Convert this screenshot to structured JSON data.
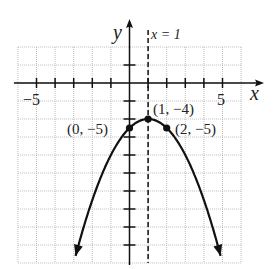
{
  "chart_data": {
    "type": "line",
    "title": "",
    "function": "y = -(x - 1)^2 - 4",
    "xlabel": "x",
    "ylabel": "y",
    "xlim": [
      -6,
      6
    ],
    "ylim": [
      -20,
      4
    ],
    "x_tick_labels": [
      "-5",
      "5"
    ],
    "x_ticks": [
      -5,
      -4,
      -3,
      -2,
      -1,
      1,
      2,
      3,
      4,
      5
    ],
    "y_ticks": [
      2,
      -2,
      -4,
      -6,
      -8,
      -10,
      -12,
      -14,
      -16,
      -18
    ],
    "grid": true,
    "axis_of_symmetry": {
      "label": "x = 1",
      "x": 1,
      "style": "dashed"
    },
    "points": [
      {
        "label": "(0, −5)",
        "x": 0,
        "y": -5
      },
      {
        "label": "(1, −4)",
        "x": 1,
        "y": -4
      },
      {
        "label": "(2, −5)",
        "x": 2,
        "y": -5
      }
    ],
    "curve_x_range": [
      -2.9,
      4.9
    ],
    "arrows_at_ends": true
  },
  "labels": {
    "x_axis": "x",
    "y_axis": "y",
    "symmetry": "x = 1",
    "tick_neg5": "−5",
    "tick_pos5": "5",
    "pt0": "(0, −5)",
    "pt1": "(1, −4)",
    "pt2": "(2, −5)"
  }
}
